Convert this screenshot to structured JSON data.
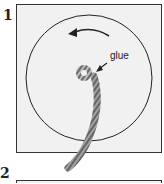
{
  "steps": [
    {
      "number": "1",
      "annotation": "glue"
    },
    {
      "number": "2"
    }
  ],
  "colors": {
    "panel_fill": "#f1f1f1",
    "line": "#222222",
    "rope": "#8a8a8a"
  }
}
